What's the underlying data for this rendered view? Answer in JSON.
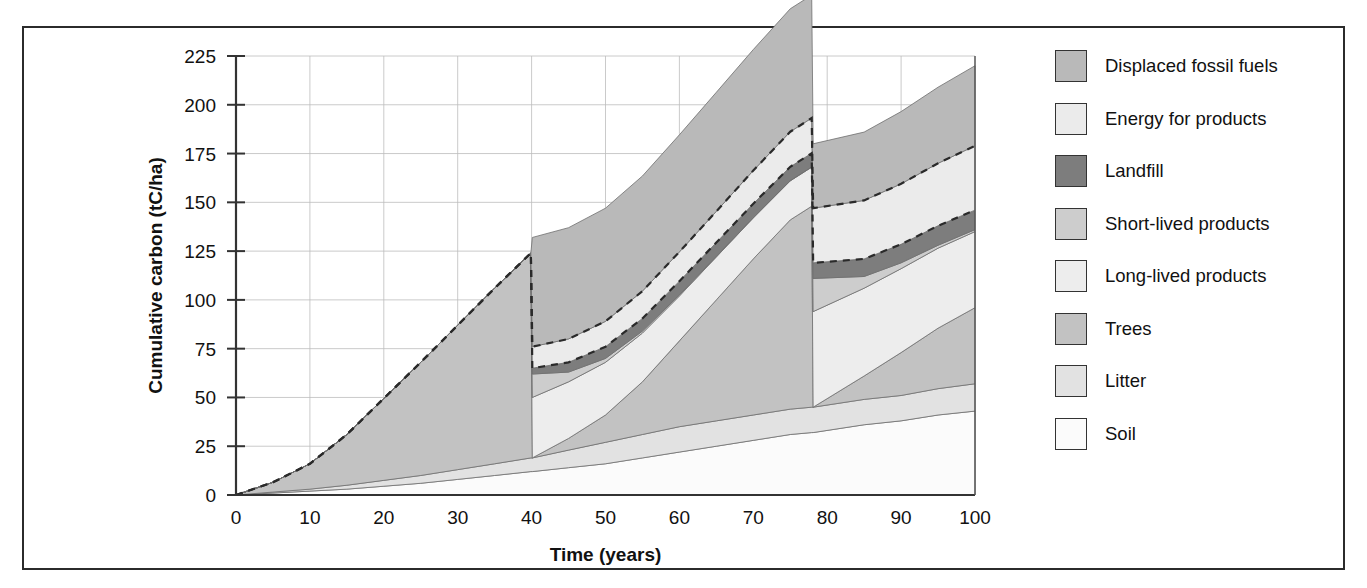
{
  "figure": {
    "border_color": "#2b2b2b",
    "background": "#ffffff"
  },
  "axes": {
    "y_title": "Cumulative carbon (tC/ha)",
    "x_title": "Time (years)",
    "y_ticks": [
      "0",
      "25",
      "50",
      "75",
      "100",
      "125",
      "150",
      "175",
      "200",
      "225"
    ],
    "x_ticks": [
      "0",
      "10",
      "20",
      "30",
      "40",
      "50",
      "60",
      "70",
      "80",
      "90",
      "100"
    ]
  },
  "legend": {
    "items": [
      {
        "label": "Displaced fossil fuels",
        "color": "#b9b9b9"
      },
      {
        "label": "Energy for products",
        "color": "#ebebeb"
      },
      {
        "label": "Landfill",
        "color": "#7d7d7d"
      },
      {
        "label": "Short-lived products",
        "color": "#cdcdcd"
      },
      {
        "label": "Long-lived products",
        "color": "#ededed"
      },
      {
        "label": "Trees",
        "color": "#c2c2c2"
      },
      {
        "label": "Litter",
        "color": "#e2e2e2"
      },
      {
        "label": "Soil",
        "color": "#fbfbfb"
      }
    ]
  },
  "chart_data": {
    "type": "area",
    "stacked": true,
    "title": "",
    "xlabel": "Time (years)",
    "ylabel": "Cumulative carbon (tC/ha)",
    "xlim": [
      0,
      100
    ],
    "ylim": [
      0,
      225
    ],
    "grid": true,
    "x": [
      0,
      5,
      10,
      15,
      20,
      25,
      30,
      35,
      39.9,
      40.1,
      45,
      50,
      55,
      60,
      65,
      70,
      75,
      77.9,
      78.1,
      85,
      90,
      95,
      100
    ],
    "harvest_years": [
      40,
      78
    ],
    "series": [
      {
        "name": "Soil",
        "color": "#fbfbfb",
        "values": [
          0,
          1,
          2,
          3,
          4.5,
          6,
          8,
          10,
          12,
          12,
          14,
          16,
          19,
          22,
          25,
          28,
          31,
          32,
          32,
          36,
          38,
          41,
          43
        ]
      },
      {
        "name": "Litter",
        "color": "#e2e2e2",
        "values": [
          0,
          0.5,
          1,
          2,
          3,
          4,
          5,
          6,
          7,
          7,
          9,
          11,
          12,
          13,
          13,
          13,
          13,
          13,
          13,
          13,
          13,
          13.5,
          14
        ]
      },
      {
        "name": "Trees",
        "color": "#c2c2c2",
        "values": [
          0,
          5,
          13,
          26,
          42,
          58,
          74,
          90,
          105,
          0,
          6,
          14,
          27,
          44,
          62,
          80,
          97,
          103,
          0,
          12,
          22,
          31,
          39
        ]
      },
      {
        "name": "Long-lived products",
        "color": "#ededed",
        "values": [
          0,
          0,
          0,
          0,
          0,
          0,
          0,
          0,
          0,
          31,
          29,
          27,
          25,
          23,
          22,
          21,
          20,
          20,
          49,
          45,
          43,
          41,
          39
        ]
      },
      {
        "name": "Short-lived products",
        "color": "#cdcdcd",
        "values": [
          0,
          0,
          0,
          0,
          0,
          0,
          0,
          0,
          0,
          12,
          5,
          2,
          1,
          0.6,
          0.4,
          0.3,
          0.2,
          0.2,
          17,
          6,
          3,
          1.5,
          1
        ]
      },
      {
        "name": "Landfill",
        "color": "#7d7d7d",
        "values": [
          0,
          0,
          0,
          0,
          0,
          0,
          0,
          0,
          0,
          3,
          5,
          6,
          6.5,
          7,
          7,
          7,
          7,
          7,
          8,
          9,
          9.5,
          10,
          10
        ]
      },
      {
        "name": "Energy for products",
        "color": "#ebebeb",
        "values": [
          0,
          0,
          0,
          0,
          0,
          0,
          0,
          0,
          0,
          11,
          12,
          13,
          14,
          15,
          16,
          17,
          18,
          18,
          28,
          30,
          31,
          32,
          33
        ]
      },
      {
        "name": "Displaced fossil fuels",
        "color": "#b9b9b9",
        "values": [
          0,
          0,
          0,
          0,
          0,
          0,
          0,
          0,
          0,
          56,
          57,
          58,
          59,
          60,
          61,
          62,
          63,
          63,
          33,
          35,
          37,
          39,
          41
        ]
      }
    ],
    "totals_note": {
      "peak_before_first_harvest": 125,
      "peak_before_second_harvest": 182,
      "value_at_100": 180
    }
  }
}
